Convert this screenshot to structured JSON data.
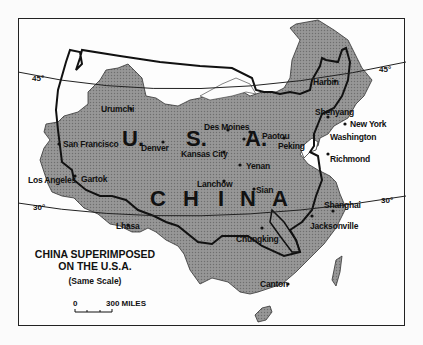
{
  "map": {
    "title_line1": "CHINA SUPERIMPOSED",
    "title_line2": "ON THE U.S.A.",
    "subtitle": "(Same Scale)",
    "scale": {
      "zero": "0",
      "label": "300 MILES"
    },
    "latitudes": {
      "north": "45°",
      "south": "30°"
    },
    "country_labels": {
      "usa": [
        "U.",
        "S.",
        "A."
      ],
      "china": [
        "C",
        "H",
        "I",
        "N",
        "A"
      ]
    },
    "us_cities": [
      "San Francisco",
      "Los Angeles",
      "Denver",
      "Kansas City",
      "Des Moines",
      "New York",
      "Washington",
      "Richmond",
      "Jacksonville"
    ],
    "china_cities": [
      "Urumchi",
      "Gartok",
      "Lhasa",
      "Lanchow",
      "Yenan",
      "Sian",
      "Paotou",
      "Peking",
      "Harbin",
      "Shenyang",
      "Shanghai",
      "Chungking",
      "Canton"
    ],
    "colors": {
      "china_fill": "#8a8a8a",
      "outline": "#111111",
      "background": "#fdfdfd"
    }
  }
}
